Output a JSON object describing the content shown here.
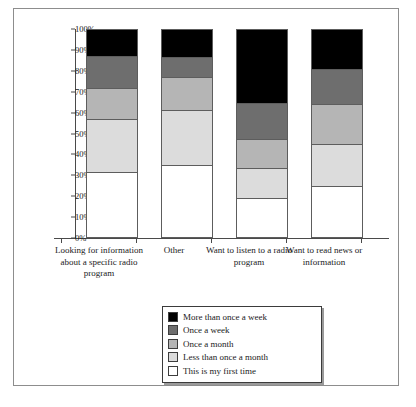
{
  "figure": {
    "caption": ""
  },
  "chart_data": {
    "type": "bar",
    "stacked": true,
    "title": "",
    "xlabel": "",
    "ylabel": "",
    "ylim": [
      0,
      100
    ],
    "y_unit": "%",
    "grid": false,
    "legend_position": "bottom-center",
    "y_ticks": [
      "0%",
      "10%",
      "20%",
      "30%",
      "40%",
      "50%",
      "60%",
      "70%",
      "80%",
      "90%",
      "100%"
    ],
    "y_tick_values": [
      0,
      10,
      20,
      30,
      40,
      50,
      60,
      70,
      80,
      90,
      100
    ],
    "categories": [
      "Looking for information about a specific radio program",
      "Other",
      "Want to listen to a radio program",
      "Want to read news or information"
    ],
    "series": [
      {
        "name": "This is my first time",
        "color": "#ffffff",
        "values": [
          31.5,
          35.0,
          19.0,
          25.0
        ]
      },
      {
        "name": "Less than once a month",
        "color": "#dcdcdc",
        "values": [
          25.5,
          26.0,
          14.5,
          20.0
        ]
      },
      {
        "name": "Once a month",
        "color": "#b5b5b5",
        "values": [
          15.0,
          16.0,
          14.0,
          19.0
        ]
      },
      {
        "name": "Once a week",
        "color": "#6e6e6e",
        "values": [
          15.0,
          9.5,
          17.0,
          17.0
        ]
      },
      {
        "name": "More than once a week",
        "color": "#000000",
        "values": [
          13.0,
          13.5,
          35.5,
          19.0
        ]
      }
    ],
    "legend_entries": [
      {
        "label": "More than once a week",
        "color": "#000000"
      },
      {
        "label": "Once a week",
        "color": "#6e6e6e"
      },
      {
        "label": "Once a month",
        "color": "#b5b5b5"
      },
      {
        "label": "Less than once a month",
        "color": "#dcdcdc"
      },
      {
        "label": "This is my first time",
        "color": "#ffffff"
      }
    ]
  }
}
